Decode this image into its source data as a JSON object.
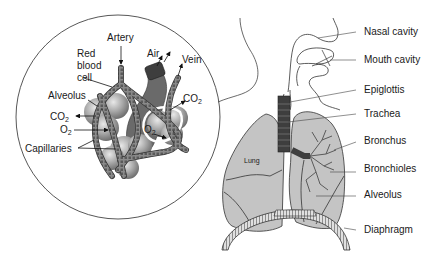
{
  "figure": {
    "inset": {
      "labels": {
        "artery": "Artery",
        "red_blood_cell": "Red\nblood\ncell",
        "red": "Red",
        "blood": "blood",
        "cell": "cell",
        "air": "Air",
        "vein": "Vein",
        "alveolus": "Alveolus",
        "co2_left": "CO",
        "co2_left_sub": "2",
        "o2_left": "O",
        "o2_left_sub": "2",
        "co2_right": "CO",
        "co2_right_sub": "2",
        "o2_right": "O",
        "o2_right_sub": "2",
        "capillaries": "Capillaries"
      }
    },
    "main": {
      "labels": {
        "nasal_cavity": "Nasal cavity",
        "mouth_cavity": "Mouth cavity",
        "epiglottis": "Epiglottis",
        "trachea": "Trachea",
        "bronchus": "Bronchus",
        "bronchioles": "Bronchioles",
        "alveolus": "Alveolus",
        "diaphragm": "Diaphragm",
        "lung": "Lung"
      }
    },
    "colors": {
      "lung_fill": "#c4c4c4",
      "alveolus_fill": "#9a9a9a",
      "capillary_fill": "#7a7a7a",
      "airway_dark": "#4a4a4a",
      "line": "#333333"
    }
  }
}
